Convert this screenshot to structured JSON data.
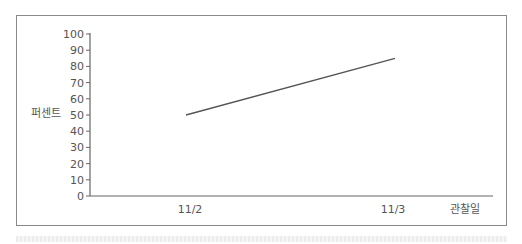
{
  "chart_data": {
    "type": "line",
    "title": "",
    "xlabel": "관찰일",
    "ylabel": "퍼센트",
    "categories": [
      "11/2",
      "11/3"
    ],
    "series": [
      {
        "name": "퍼센트",
        "values": [
          50,
          85
        ],
        "color": "#555555"
      }
    ],
    "ylim": [
      0,
      100
    ],
    "yticks": [
      0,
      10,
      20,
      30,
      40,
      50,
      60,
      70,
      80,
      90,
      100
    ],
    "grid": false,
    "legend": "none"
  },
  "labels": {
    "ylabel": "퍼센트",
    "xlabel": "관찰일",
    "x_cat_0": "11/2",
    "x_cat_1": "11/3",
    "y": [
      "0",
      "10",
      "20",
      "30",
      "40",
      "50",
      "60",
      "70",
      "80",
      "90",
      "100"
    ]
  }
}
